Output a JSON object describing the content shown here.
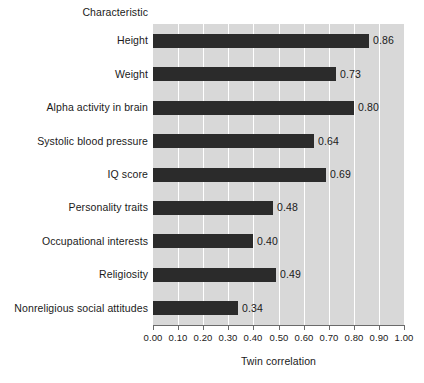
{
  "chart_data": {
    "type": "bar",
    "orientation": "horizontal",
    "title": "",
    "category_axis_title": "Characteristic",
    "xlabel": "Twin correlation",
    "ylabel": "",
    "xlim": [
      0.0,
      1.0
    ],
    "grid": true,
    "legend": "none",
    "xticks": [
      "0.00",
      "0.10",
      "0.20",
      "0.30",
      "0.40",
      "0.50",
      "0.60",
      "0.70",
      "0.80",
      "0.90",
      "1.00"
    ],
    "xtick_values": [
      0.0,
      0.1,
      0.2,
      0.3,
      0.4,
      0.5,
      0.6,
      0.7,
      0.8,
      0.9,
      1.0
    ],
    "categories": [
      "Height",
      "Weight",
      "Alpha activity in brain",
      "Systolic blood pressure",
      "IQ score",
      "Personality traits",
      "Occupational interests",
      "Religiosity",
      "Nonreligious social attitudes"
    ],
    "values": [
      0.86,
      0.73,
      0.8,
      0.64,
      0.69,
      0.48,
      0.4,
      0.49,
      0.34
    ],
    "value_labels": [
      "0.86",
      "0.73",
      "0.80",
      "0.64",
      "0.69",
      "0.48",
      "0.40",
      "0.49",
      "0.34"
    ],
    "colors": {
      "bar": "#2b2b2b",
      "plot_background": "#d8d8d8",
      "gridline": "#ffffff",
      "axis": "#6a6a6a",
      "text": "#1a1a1a",
      "page_background": "#ffffff"
    }
  }
}
